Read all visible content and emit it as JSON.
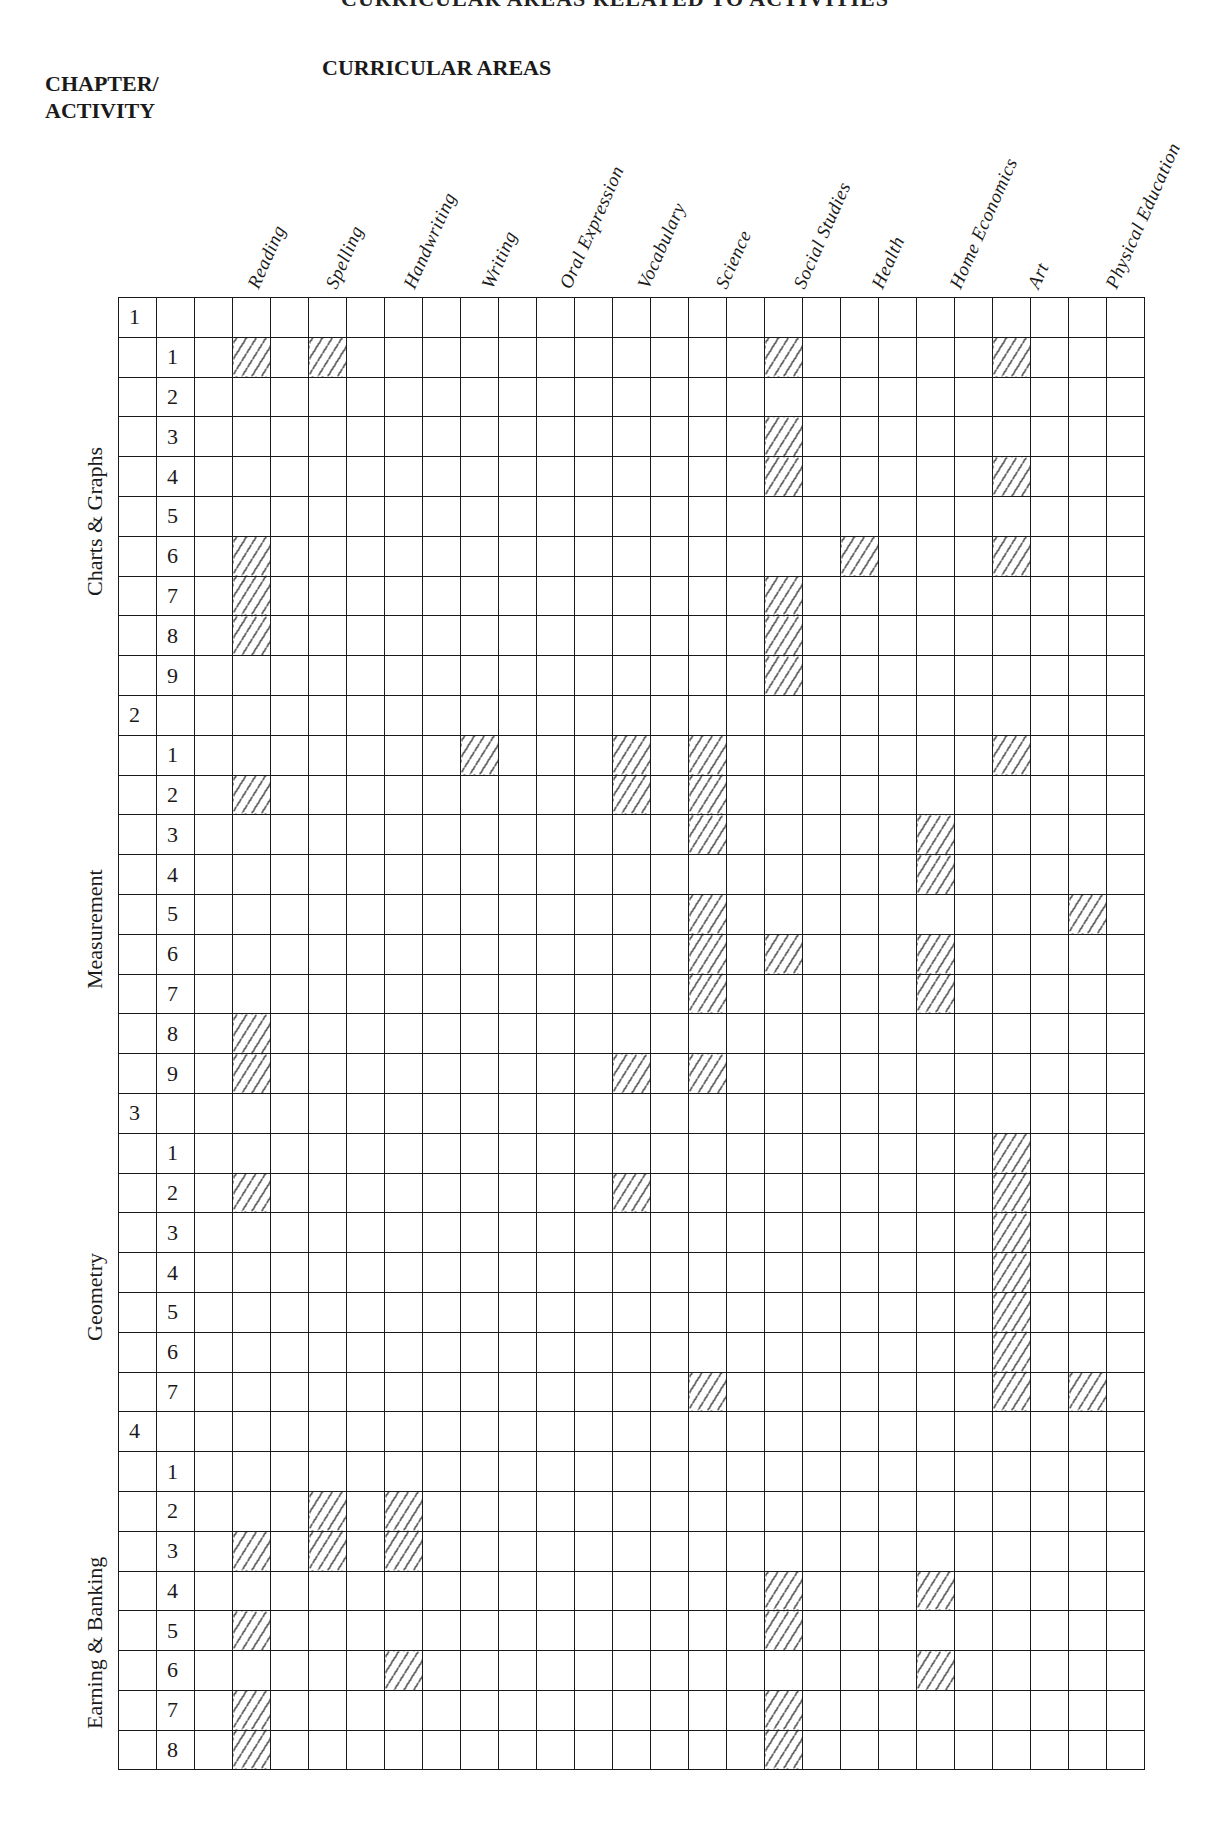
{
  "page": {
    "top_title_partial": "CURRICULAR AREAS RELATED TO ACTIVITIES",
    "chapter_header_line1": "CHAPTER/",
    "chapter_header_line2": "ACTIVITY",
    "areas_header": "CURRICULAR AREAS"
  },
  "subjects": [
    "Reading",
    "Spelling",
    "Handwriting",
    "Writing",
    "Oral Expression",
    "Vocabulary",
    "Science",
    "Social Studies",
    "Health",
    "Home Economics",
    "Art",
    "Physical Education"
  ],
  "chapters": [
    {
      "number": "1",
      "title": "Charts & Graphs",
      "activities": [
        {
          "n": "1",
          "areas": [
            "Reading",
            "Spelling",
            "Social Studies",
            "Art"
          ]
        },
        {
          "n": "2",
          "areas": []
        },
        {
          "n": "3",
          "areas": [
            "Social Studies"
          ]
        },
        {
          "n": "4",
          "areas": [
            "Social Studies",
            "Art"
          ]
        },
        {
          "n": "5",
          "areas": []
        },
        {
          "n": "6",
          "areas": [
            "Reading",
            "Health",
            "Art"
          ]
        },
        {
          "n": "7",
          "areas": [
            "Reading",
            "Social Studies"
          ]
        },
        {
          "n": "8",
          "areas": [
            "Reading",
            "Social Studies"
          ]
        },
        {
          "n": "9",
          "areas": [
            "Social Studies"
          ]
        }
      ]
    },
    {
      "number": "2",
      "title": "Measurement",
      "activities": [
        {
          "n": "1",
          "areas": [
            "Writing",
            "Vocabulary",
            "Science",
            "Art"
          ]
        },
        {
          "n": "2",
          "areas": [
            "Reading",
            "Vocabulary",
            "Science"
          ]
        },
        {
          "n": "3",
          "areas": [
            "Science",
            "Home Economics"
          ]
        },
        {
          "n": "4",
          "areas": [
            "Home Economics"
          ]
        },
        {
          "n": "5",
          "areas": [
            "Science",
            "Physical Education"
          ]
        },
        {
          "n": "6",
          "areas": [
            "Science",
            "Social Studies",
            "Home Economics"
          ]
        },
        {
          "n": "7",
          "areas": [
            "Science",
            "Home Economics"
          ]
        },
        {
          "n": "8",
          "areas": [
            "Reading"
          ]
        },
        {
          "n": "9",
          "areas": [
            "Reading",
            "Vocabulary",
            "Science"
          ]
        }
      ]
    },
    {
      "number": "3",
      "title": "Geometry",
      "activities": [
        {
          "n": "1",
          "areas": [
            "Art"
          ]
        },
        {
          "n": "2",
          "areas": [
            "Reading",
            "Vocabulary",
            "Art"
          ]
        },
        {
          "n": "3",
          "areas": [
            "Art"
          ]
        },
        {
          "n": "4",
          "areas": [
            "Art"
          ]
        },
        {
          "n": "5",
          "areas": [
            "Art"
          ]
        },
        {
          "n": "6",
          "areas": [
            "Art"
          ]
        },
        {
          "n": "7",
          "areas": [
            "Science",
            "Art",
            "Physical Education"
          ]
        }
      ]
    },
    {
      "number": "4",
      "title": "Earning & Banking",
      "activities": [
        {
          "n": "1",
          "areas": []
        },
        {
          "n": "2",
          "areas": [
            "Spelling",
            "Handwriting"
          ]
        },
        {
          "n": "3",
          "areas": [
            "Reading",
            "Spelling",
            "Handwriting"
          ]
        },
        {
          "n": "4",
          "areas": [
            "Social Studies",
            "Home Economics"
          ]
        },
        {
          "n": "5",
          "areas": [
            "Reading",
            "Social Studies"
          ]
        },
        {
          "n": "6",
          "areas": [
            "Handwriting",
            "Home Economics"
          ]
        },
        {
          "n": "7",
          "areas": [
            "Reading",
            "Social Studies"
          ]
        },
        {
          "n": "8",
          "areas": [
            "Reading",
            "Social Studies"
          ]
        }
      ]
    }
  ],
  "legend": {
    "hatch_meaning": "activity relates to curricular area",
    "hatch_color": "#333333",
    "line_color": "#1a1a1a"
  }
}
